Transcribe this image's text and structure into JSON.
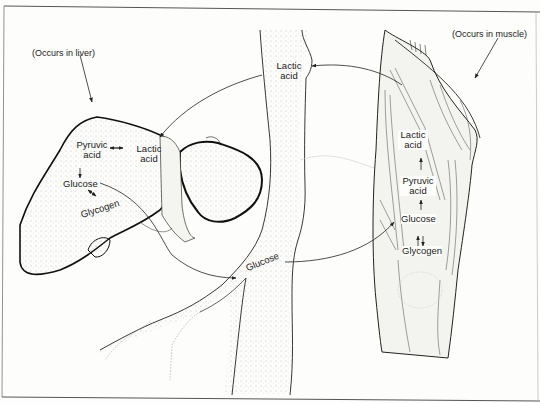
{
  "diagram": {
    "type": "cori-cycle-illustration",
    "captions": {
      "liver": "(Occurs in liver)",
      "muscle": "(Occurs in muscle)"
    },
    "liver_labels": {
      "pyruvic_1": "Pyruvic",
      "pyruvic_2": "acid",
      "lactic_1": "Lactic",
      "lactic_2": "acid",
      "glucose": "Glucose",
      "glycogen": "Glycogen"
    },
    "vessel_labels": {
      "lactic_1": "Lactic",
      "lactic_2": "acid",
      "glucose": "Glucose"
    },
    "muscle_labels": {
      "lactic_1": "Lactic",
      "lactic_2": "acid",
      "pyruvic_1": "Pyruvic",
      "pyruvic_2": "acid",
      "glucose": "Glucose",
      "glycogen": "Glycogen"
    },
    "flows": [
      {
        "from": "muscle",
        "to": "blood",
        "substance": "Lactic acid"
      },
      {
        "from": "blood",
        "to": "liver",
        "substance": "Lactic acid"
      },
      {
        "from": "liver",
        "to": "blood",
        "substance": "Glucose"
      },
      {
        "from": "blood",
        "to": "muscle",
        "substance": "Glucose"
      }
    ]
  }
}
